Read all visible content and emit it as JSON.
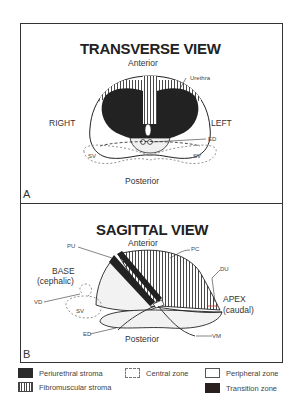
{
  "panel_a": {
    "letter": "A",
    "title": "TRANSVERSE VIEW",
    "top_label": "Anterior",
    "bottom_label": "Posterior",
    "left_label": "RIGHT",
    "right_label": "LEFT",
    "callouts": {
      "urethra": "Urethra",
      "ed": "ED",
      "sv_left": "SV",
      "sv_right": "SV"
    }
  },
  "panel_b": {
    "letter": "B",
    "title": "SAGITTAL VIEW",
    "top_label": "Anterior",
    "bottom_label": "Posterior",
    "base_label": "BASE",
    "base_sub": "(cephalic)",
    "apex_label": "APEX",
    "apex_sub": "(caudal)",
    "callouts": {
      "pu": "PU",
      "pc": "PC",
      "du": "DU",
      "vd": "VD",
      "sv": "SV",
      "ed": "ED",
      "vm": "VM"
    }
  },
  "legend": {
    "items": [
      {
        "label": "Periurethral stroma",
        "swatch": "periurethral-stroma"
      },
      {
        "label": "Central zone",
        "swatch": "central-zone"
      },
      {
        "label": "Peripheral zone",
        "swatch": "peripheral-zone"
      },
      {
        "label": "Fibromuscular stroma",
        "swatch": "fibromuscular-stroma"
      },
      {
        "label": "Transition zone",
        "swatch": "transition-zone"
      }
    ]
  },
  "colors": {
    "dark_fill": "#2a2a2a",
    "transition_fill": "#2a1f1f",
    "line": "#333333",
    "light_fill": "#f2f2f2",
    "accent_red": "#c0392b"
  }
}
